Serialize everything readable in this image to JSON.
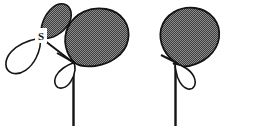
{
  "figure": {
    "type": "chemistry-orbital-diagram",
    "width": 278,
    "height": 133,
    "background_color": "#ffffff"
  },
  "colors": {
    "lobe_fill_shaded": "#5a5a5a",
    "lobe_fill_empty": "#ffffff",
    "stroke": "#141414",
    "label_box_fill": "#ffffff",
    "bond_line": "#141414"
  },
  "labels": {
    "sulfur": "S"
  },
  "centers": [
    {
      "name": "sulfur-center",
      "label": "S",
      "x": 41,
      "y": 37
    },
    {
      "name": "carbon-center-left",
      "x": 73,
      "y": 62
    },
    {
      "name": "carbon-center-right",
      "x": 175,
      "y": 62
    }
  ],
  "orbitals": [
    {
      "name": "sulfur-p-orbital",
      "shaded_lobe": "up-right",
      "empty_lobe": "down-left",
      "size": "small"
    },
    {
      "name": "carbon-p-orbital-left",
      "shaded_lobe": "up-left",
      "empty_lobe": "down-left",
      "size": "large"
    },
    {
      "name": "carbon-p-orbital-right",
      "shaded_lobe": "up-left",
      "empty_lobe": "down-right",
      "size": "large"
    }
  ],
  "bonds": [
    {
      "name": "bond-sulfur-to-carbon",
      "from": "sulfur-center",
      "to": "carbon-center-left"
    },
    {
      "name": "bond-carbon-left-vertical",
      "from": "carbon-center-left",
      "direction": "down"
    },
    {
      "name": "bond-carbon-right-vertical",
      "from": "carbon-center-right",
      "direction": "down"
    },
    {
      "name": "bond-carbon-right-upper",
      "from": "carbon-center-right",
      "direction": "up-right"
    }
  ]
}
